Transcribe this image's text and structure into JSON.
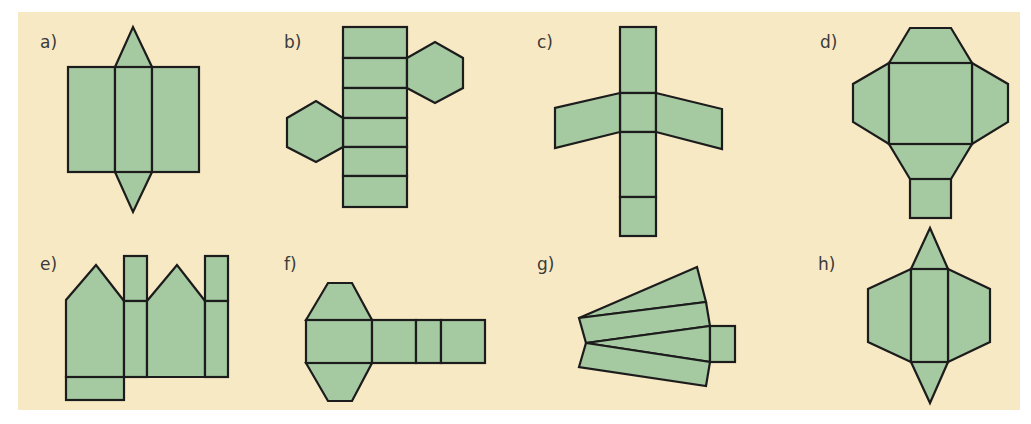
{
  "figure": {
    "colors": {
      "background": "#f8e9c5",
      "face": "#a5c9a0",
      "edge": "#1c1c1c",
      "label": "#3a3a3a"
    },
    "nets": [
      {
        "label": "a)",
        "solid": "triangular prism net",
        "faces": [
          "rectangle",
          "rectangle",
          "rectangle",
          "triangle",
          "triangle"
        ]
      },
      {
        "label": "b)",
        "solid": "hexagonal prism net",
        "faces": [
          "rectangle",
          "rectangle",
          "rectangle",
          "rectangle",
          "rectangle",
          "rectangle",
          "hexagon",
          "hexagon"
        ]
      },
      {
        "label": "c)",
        "solid": "prism net with trapezoid wings",
        "faces": [
          "rectangle",
          "rectangle",
          "rectangle",
          "rectangle",
          "trapezoid",
          "trapezoid"
        ]
      },
      {
        "label": "d)",
        "solid": "frustum-style net around a square",
        "faces": [
          "square",
          "trapezoid",
          "trapezoid",
          "trapezoid",
          "trapezoid",
          "square"
        ]
      },
      {
        "label": "e)",
        "solid": "pentagonal prism net",
        "faces": [
          "pentagon",
          "rectangle",
          "rectangle",
          "pentagon",
          "rectangle",
          "rectangle",
          "rectangle"
        ]
      },
      {
        "label": "f)",
        "solid": "prism net with trapezoid caps",
        "faces": [
          "rectangle",
          "trapezoid",
          "trapezoid",
          "rectangle",
          "rectangle",
          "rectangle"
        ]
      },
      {
        "label": "g)",
        "solid": "fan-shaped net",
        "faces": [
          "trapezoid",
          "trapezoid",
          "trapezoid",
          "trapezoid",
          "rectangle"
        ]
      },
      {
        "label": "h)",
        "solid": "triangular prism net with trapezoid sides",
        "faces": [
          "rectangle",
          "triangle",
          "triangle",
          "trapezoid",
          "trapezoid"
        ]
      }
    ]
  }
}
